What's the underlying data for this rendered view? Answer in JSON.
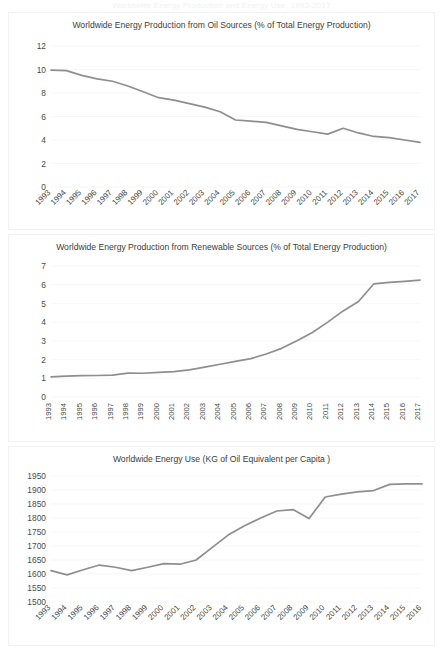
{
  "page": {
    "top_cropped_text": "Worldwide Energy Production and Energy Use, 1993-2017",
    "background_color": "#ffffff",
    "line_color": "#8e8e8e",
    "grid_color": "#f4f4f5",
    "text_color": "#3c3c3c"
  },
  "chart_data": [
    {
      "id": "oil",
      "type": "line",
      "title": "Worldwide Energy Production from Oil Sources (% of Total Energy Production)",
      "xlabel": "",
      "ylabel": "",
      "ylim": [
        0,
        12
      ],
      "yticks": [
        0,
        2,
        4,
        6,
        8,
        10,
        12
      ],
      "grid": true,
      "legend": "none",
      "xtick_rotation": -45,
      "categories": [
        "1993",
        "1994",
        "1995",
        "1996",
        "1997",
        "1998",
        "1999",
        "2000",
        "2001",
        "2002",
        "2003",
        "2004",
        "2005",
        "2006",
        "2007",
        "2008",
        "2009",
        "2010",
        "2011",
        "2012",
        "2013",
        "2014",
        "2015",
        "2016",
        "2017"
      ],
      "values": [
        9.95,
        9.9,
        9.5,
        9.2,
        9.0,
        8.6,
        8.1,
        7.6,
        7.4,
        7.1,
        6.8,
        6.4,
        5.7,
        5.6,
        5.5,
        5.2,
        4.9,
        4.7,
        4.5,
        5.0,
        4.6,
        4.3,
        4.2,
        4.0,
        3.8,
        3.7
      ]
    },
    {
      "id": "renewable",
      "type": "line",
      "title": "Worldwide Energy Production from Renewable Sources (% of Total Energy Production)",
      "xlabel": "",
      "ylabel": "",
      "ylim": [
        0,
        7
      ],
      "yticks": [
        0,
        1,
        2,
        3,
        4,
        5,
        6,
        7
      ],
      "grid": true,
      "legend": "none",
      "xtick_rotation": -90,
      "categories": [
        "1993",
        "1994",
        "1995",
        "1996",
        "1997",
        "1998",
        "1999",
        "2000",
        "2001",
        "2002",
        "2003",
        "2004",
        "2005",
        "2006",
        "2007",
        "2008",
        "2009",
        "2010",
        "2011",
        "2012",
        "2013",
        "2014",
        "2015",
        "2016",
        "2017"
      ],
      "values": [
        1.08,
        1.12,
        1.14,
        1.15,
        1.17,
        1.28,
        1.27,
        1.32,
        1.36,
        1.45,
        1.6,
        1.75,
        1.9,
        2.05,
        2.3,
        2.6,
        3.0,
        3.45,
        4.0,
        4.6,
        5.1,
        6.05,
        6.12,
        6.18,
        6.25
      ]
    },
    {
      "id": "energy-use",
      "type": "line",
      "title": "Worldwide Energy Use (KG of Oil Equivalent per Capita )",
      "xlabel": "",
      "ylabel": "",
      "ylim": [
        1500,
        1950
      ],
      "yticks": [
        1500,
        1550,
        1600,
        1650,
        1700,
        1750,
        1800,
        1850,
        1900,
        1950
      ],
      "grid": true,
      "legend": "none",
      "xtick_rotation": -45,
      "categories": [
        "1993",
        "1994",
        "1995",
        "1996",
        "1997",
        "1998",
        "1999",
        "2000",
        "2001",
        "2002",
        "2003",
        "2004",
        "2005",
        "2006",
        "2007",
        "2008",
        "2009",
        "2010",
        "2011",
        "2012",
        "2013",
        "2014",
        "2015",
        "2016"
      ],
      "values": [
        1612,
        1597,
        1615,
        1632,
        1624,
        1612,
        1624,
        1637,
        1635,
        1650,
        1695,
        1740,
        1772,
        1800,
        1825,
        1830,
        1798,
        1875,
        1885,
        1893,
        1898,
        1920,
        1922,
        1922
      ]
    }
  ]
}
